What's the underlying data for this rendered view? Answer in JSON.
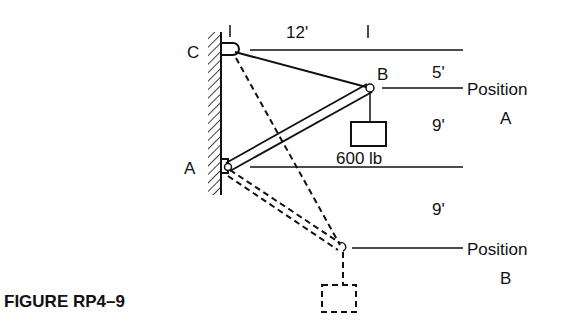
{
  "figure": {
    "caption": "FIGURE RP4–9",
    "ink_color": "#111111",
    "background": "#ffffff"
  },
  "labels": {
    "point_c": "C",
    "point_b": "B",
    "point_a": "A",
    "dim_horizontal": "12'",
    "dim_cb": "5'",
    "dim_ba": "9'",
    "dim_a_posb": "9'",
    "weight": "600 lb",
    "position_a_line1": "Position",
    "position_a_line2": "A",
    "position_b_line1": "Position",
    "position_b_line2": "B"
  }
}
